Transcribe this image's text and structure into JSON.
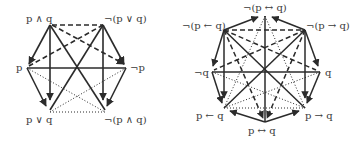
{
  "colors": {
    "line": "#2b2b2b",
    "text": "#3a3a3a",
    "background": "#ffffff"
  },
  "hexagon": {
    "labels": {
      "top_left": "p ∧ q",
      "top_right": "¬(p ∨ q)",
      "left": "p",
      "right": "¬p",
      "bottom_left": "p ∨ q",
      "bottom_right": "¬(p ∧ q)"
    },
    "edge_styles": {
      "solid_arrow": "implication",
      "dashed": "contrariety",
      "dotted": "subcontrariety"
    }
  },
  "octagon": {
    "labels": {
      "top": "¬(p ↔ q)",
      "top_left": "¬(p ← q)",
      "top_right": "¬(p → q)",
      "left": "¬q",
      "right": "q",
      "bottom_left": "p ← q",
      "bottom_right": "p → q",
      "bottom": "p ↔ q"
    }
  }
}
